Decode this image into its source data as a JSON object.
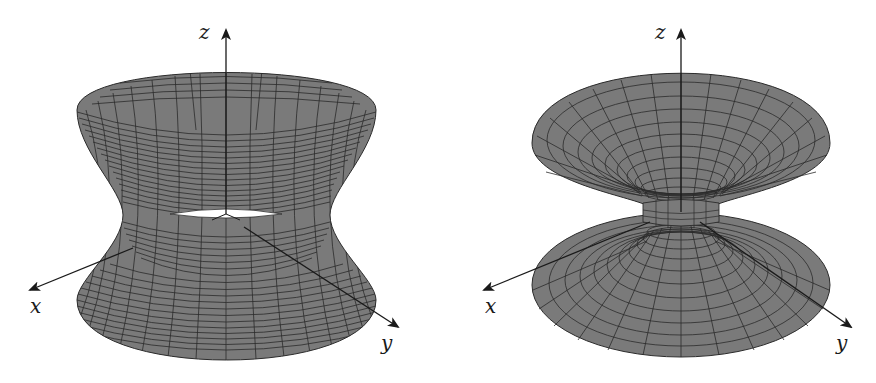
{
  "colors": {
    "surface_fill": "#7a7a7a",
    "mesh_line": "#2b2b2b",
    "axis": "#1a1a1a",
    "background": "#ffffff"
  },
  "figures": [
    {
      "name": "hyperboloid-of-one-sheet",
      "axes": {
        "x": "x",
        "y": "y",
        "z": "z"
      }
    },
    {
      "name": "funnel-catenoid-surface",
      "axes": {
        "x": "x",
        "y": "y",
        "z": "z"
      }
    }
  ]
}
